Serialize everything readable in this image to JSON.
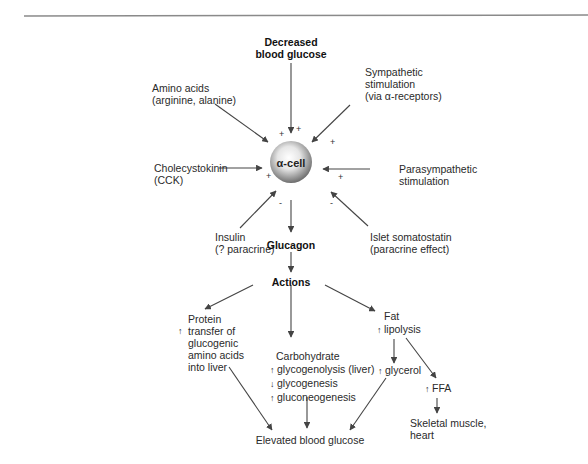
{
  "diagram": {
    "title_rule": true,
    "center_node": {
      "label": "α-cell",
      "shape": "sphere",
      "color": "#9a9a9a"
    },
    "inputs": {
      "top": {
        "line1": "Decreased",
        "line2": "blood glucose",
        "effect": "+"
      },
      "top_left": {
        "line1": "Amino acids",
        "line2": "(arginine, alanine)",
        "effect": "+"
      },
      "top_right": {
        "line1": "Sympathetic",
        "line2": "stimulation",
        "line3": "(via α-receptors)",
        "effect": "+"
      },
      "left": {
        "line1": "Cholecystokinin",
        "line2": "(CCK)",
        "effect": "+"
      },
      "right": {
        "line1": "Parasympathetic",
        "line2": "stimulation",
        "effect": "+"
      },
      "bottom_left": {
        "line1": "Insulin",
        "line2": "(? paracrine)",
        "effect": "-"
      },
      "bottom_right": {
        "line1": "Islet somatostatin",
        "line2": "(paracrine effect)",
        "effect": "-"
      }
    },
    "output": {
      "label": "Glucagon"
    },
    "actions": {
      "label": "Actions"
    },
    "branches": {
      "protein": {
        "line1": "Protein",
        "line2": "transfer of",
        "line3": "glucogenic",
        "line4": "amino acids",
        "line5": "into liver",
        "arrow": "↑"
      },
      "carbohydrate": {
        "title": "Carbohydrate",
        "items": [
          {
            "arrow": "↑",
            "text": "glycogenolysis (liver)"
          },
          {
            "arrow": "↓",
            "text": "glycogenesis"
          },
          {
            "arrow": "↑",
            "text": "gluconeogenesis"
          }
        ]
      },
      "fat": {
        "title": "Fat",
        "lipolysis": {
          "arrow": "↑",
          "text": "lipolysis"
        },
        "glycerol": {
          "arrow": "↑",
          "text": "glycerol"
        },
        "ffa": {
          "arrow": "↑",
          "text": "FFA"
        },
        "ffa_target": {
          "line1": "Skeletal muscle,",
          "line2": "heart"
        }
      }
    },
    "result": {
      "label": "Elevated blood glucose"
    },
    "colors": {
      "line": "#444444",
      "rule": "#8a8a8a",
      "text": "#222222"
    }
  }
}
